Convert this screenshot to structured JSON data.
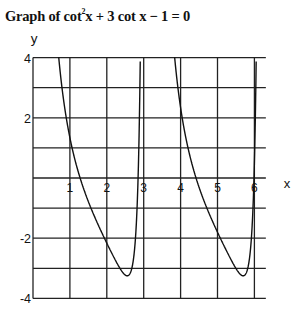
{
  "title": {
    "prefix": "Graph of cot",
    "superscript": "2",
    "suffix": "x + 3 cot x − 1 = 0"
  },
  "chart_data": {
    "type": "line",
    "function": "y = cot^2(x) + 3cot(x) - 1",
    "xlabel": "x",
    "ylabel": "y",
    "xlim": [
      0,
      6.2832
    ],
    "ylim": [
      -4,
      4
    ],
    "grid": true,
    "x_ticks": [
      1,
      2,
      3,
      4,
      5,
      6
    ],
    "x_tick_labels": [
      "1",
      "2",
      "3",
      "4",
      "5",
      "6"
    ],
    "y_ticks": [
      4,
      3,
      2,
      1,
      0,
      -1,
      -2,
      -3,
      -4
    ],
    "y_tick_labels": [
      {
        "v": 4,
        "t": "4"
      },
      {
        "v": 2,
        "t": "2"
      },
      {
        "v": -2,
        "t": "-2"
      },
      {
        "v": -4,
        "t": "-4"
      }
    ],
    "series": [
      {
        "name": "cot²x + 3cot x − 1",
        "branches": [
          [
            0.01,
            3.1316
          ],
          [
            3.1516,
            6.2732
          ]
        ],
        "sample_points": [
          {
            "x": 0.698,
            "y": 4
          },
          {
            "x": 1,
            "y": 1.34
          },
          {
            "x": 2,
            "y": -2.11
          },
          {
            "x": 2.554,
            "y": -3.25
          },
          {
            "x": 2.907,
            "y": 4
          },
          {
            "x": 3.84,
            "y": 4
          },
          {
            "x": 4.14,
            "y": 1.34
          },
          {
            "x": 5.0,
            "y": -2.4
          },
          {
            "x": 5.696,
            "y": -3.25
          },
          {
            "x": 6.049,
            "y": 4
          }
        ]
      }
    ],
    "color": "#111111"
  }
}
